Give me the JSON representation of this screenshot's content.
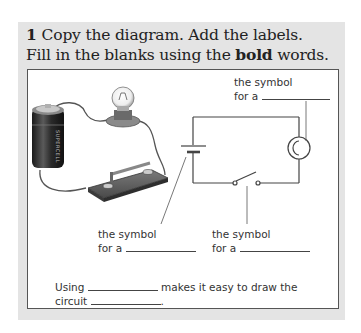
{
  "exercise": {
    "number": "1",
    "instruction_line1": "Copy the diagram. Add the labels.",
    "instruction_line2_prefix": "Fill in the blanks using the ",
    "instruction_line2_bold": "bold",
    "instruction_line2_suffix": " words."
  },
  "labels": {
    "bulb": {
      "line1": "the symbol",
      "line2": "for a"
    },
    "cell": {
      "line1": "the symbol",
      "line2": "for a"
    },
    "switch": {
      "line1": "the symbol",
      "line2": "for a"
    }
  },
  "sentence": {
    "line1_prefix": "Using",
    "line1_suffix": "makes it easy to draw the",
    "line2_prefix": "circuit",
    "line2_suffix": "."
  },
  "illustration": {
    "components": [
      "battery-cell",
      "light-bulb",
      "switch",
      "wires"
    ],
    "cell_text": "SUPERCELL"
  },
  "colors": {
    "frame_bg": "#e4e4e4",
    "panel_bg": "#ffffff",
    "line": "#444444"
  }
}
